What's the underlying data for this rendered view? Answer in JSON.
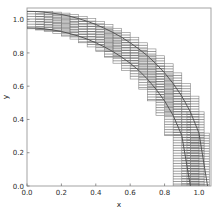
{
  "figure": {
    "background_color": "#ffffff",
    "frame_color": "#9a9a9a",
    "curve_color": "#4d4d4d",
    "box_color": "#8c8c8c",
    "hatch_color": "#5a5a5a",
    "tick_color": "#777777",
    "text_color": "#2b2b2b"
  },
  "chart_data": {
    "type": "line",
    "title": "",
    "xlabel": "x",
    "ylabel": "y",
    "xlim": [
      0.0,
      1.07
    ],
    "ylim": [
      0.0,
      1.07
    ],
    "grid": false,
    "legend": null,
    "xticks": [
      0.0,
      0.2,
      0.4,
      0.6,
      0.8,
      1.0
    ],
    "xtick_labels": [
      "0.0",
      "0.2",
      "0.4",
      "0.6",
      "0.8",
      "1.0"
    ],
    "yticks": [
      0.0,
      0.2,
      0.4,
      0.6,
      0.8,
      1.0
    ],
    "ytick_labels": [
      "0.0",
      "0.2",
      "0.4",
      "0.6",
      "0.8",
      "1.0"
    ],
    "series": [
      {
        "name": "outer-arc",
        "kind": "line",
        "radius": 1.05,
        "x": [
          0.0,
          0.05,
          0.1,
          0.15,
          0.2,
          0.25,
          0.3,
          0.35,
          0.4,
          0.45,
          0.5,
          0.55,
          0.6,
          0.65,
          0.7,
          0.75,
          0.8,
          0.85,
          0.9,
          0.95,
          1.0,
          1.05
        ],
        "values": [
          1.05,
          1.049,
          1.045,
          1.039,
          1.031,
          1.02,
          1.006,
          0.99,
          0.971,
          0.948,
          0.923,
          0.894,
          0.861,
          0.824,
          0.783,
          0.735,
          0.68,
          0.616,
          0.54,
          0.446,
          0.318,
          0.0
        ]
      },
      {
        "name": "inner-arc",
        "kind": "line",
        "radius": 0.95,
        "x": [
          0.0,
          0.05,
          0.1,
          0.15,
          0.2,
          0.25,
          0.3,
          0.35,
          0.4,
          0.45,
          0.5,
          0.55,
          0.6,
          0.65,
          0.7,
          0.75,
          0.8,
          0.85,
          0.9,
          0.95
        ],
        "values": [
          0.95,
          0.949,
          0.945,
          0.938,
          0.929,
          0.916,
          0.901,
          0.883,
          0.861,
          0.836,
          0.808,
          0.775,
          0.738,
          0.695,
          0.643,
          0.582,
          0.512,
          0.424,
          0.304,
          0.0
        ]
      }
    ],
    "boxes": {
      "name": "hatched-interval-boxes",
      "hatch": "horizontal",
      "hatch_spacing": 0.0155,
      "x_step": 0.05,
      "x_overlap": 0.05,
      "count": 21,
      "rects": [
        {
          "x0": 0.0,
          "x1": 0.1,
          "y0": 0.945,
          "y1": 1.05
        },
        {
          "x0": 0.05,
          "x1": 0.15,
          "y0": 0.938,
          "y1": 1.049
        },
        {
          "x0": 0.1,
          "x1": 0.2,
          "y0": 0.929,
          "y1": 1.045
        },
        {
          "x0": 0.15,
          "x1": 0.25,
          "y0": 0.916,
          "y1": 1.039
        },
        {
          "x0": 0.2,
          "x1": 0.3,
          "y0": 0.901,
          "y1": 1.031
        },
        {
          "x0": 0.25,
          "x1": 0.35,
          "y0": 0.883,
          "y1": 1.02
        },
        {
          "x0": 0.3,
          "x1": 0.4,
          "y0": 0.861,
          "y1": 1.006
        },
        {
          "x0": 0.35,
          "x1": 0.45,
          "y0": 0.836,
          "y1": 0.99
        },
        {
          "x0": 0.4,
          "x1": 0.5,
          "y0": 0.808,
          "y1": 0.971
        },
        {
          "x0": 0.45,
          "x1": 0.55,
          "y0": 0.775,
          "y1": 0.948
        },
        {
          "x0": 0.5,
          "x1": 0.6,
          "y0": 0.738,
          "y1": 0.923
        },
        {
          "x0": 0.55,
          "x1": 0.65,
          "y0": 0.695,
          "y1": 0.894
        },
        {
          "x0": 0.6,
          "x1": 0.7,
          "y0": 0.643,
          "y1": 0.861
        },
        {
          "x0": 0.65,
          "x1": 0.75,
          "y0": 0.582,
          "y1": 0.824
        },
        {
          "x0": 0.7,
          "x1": 0.8,
          "y0": 0.512,
          "y1": 0.783
        },
        {
          "x0": 0.75,
          "x1": 0.85,
          "y0": 0.424,
          "y1": 0.735
        },
        {
          "x0": 0.8,
          "x1": 0.9,
          "y0": 0.304,
          "y1": 0.68
        },
        {
          "x0": 0.85,
          "x1": 0.95,
          "y0": 0.0,
          "y1": 0.616
        },
        {
          "x0": 0.9,
          "x1": 1.0,
          "y0": 0.0,
          "y1": 0.54
        },
        {
          "x0": 0.93,
          "x1": 1.03,
          "y0": 0.0,
          "y1": 0.446
        },
        {
          "x0": 0.95,
          "x1": 1.06,
          "y0": 0.0,
          "y1": 0.318
        }
      ]
    }
  }
}
